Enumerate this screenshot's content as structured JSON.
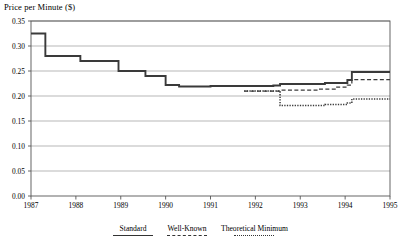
{
  "chart_data": {
    "type": "line",
    "title": "Price per Minute ($)",
    "xlabel": "",
    "ylabel": "Price per Minute ($)",
    "ylim": [
      0.0,
      0.35
    ],
    "xlim": [
      1987,
      1995
    ],
    "ytick_labels": [
      "0.00",
      "0.05",
      "0.10",
      "0.15",
      "0.20",
      "0.25",
      "0.30",
      "0.35"
    ],
    "ytick_values": [
      0.0,
      0.05,
      0.1,
      0.15,
      0.2,
      0.25,
      0.3,
      0.35
    ],
    "xtick_labels": [
      "1987",
      "1988",
      "1989",
      "1990",
      "1991",
      "1992",
      "1993",
      "1994",
      "1995"
    ],
    "xtick_values": [
      1987,
      1988,
      1989,
      1990,
      1991,
      1992,
      1993,
      1994,
      1995
    ],
    "grid": "horizontal",
    "legend_position": "below-axis",
    "step_style": "post",
    "series": [
      {
        "name": "Standard",
        "style": "solid",
        "x": [
          1987.0,
          1987.3,
          1987.32,
          1988.1,
          1988.95,
          1989.55,
          1990.0,
          1990.3,
          1991.0,
          1992.4,
          1992.55,
          1993.55,
          1994.05,
          1994.15,
          1995.0
        ],
        "values": [
          0.325,
          0.325,
          0.28,
          0.27,
          0.25,
          0.24,
          0.222,
          0.219,
          0.22,
          0.221,
          0.224,
          0.226,
          0.232,
          0.248,
          0.248
        ]
      },
      {
        "name": "Well-Known",
        "style": "dashed",
        "x": [
          1991.75,
          1992.4,
          1992.55,
          1993.4,
          1993.8,
          1994.05,
          1994.15,
          1995.0
        ],
        "values": [
          0.21,
          0.21,
          0.212,
          0.214,
          0.218,
          0.222,
          0.233,
          0.233
        ]
      },
      {
        "name": "Theoretical Minimum",
        "style": "dotted",
        "x": [
          1991.75,
          1992.4,
          1992.55,
          1993.55,
          1994.05,
          1994.15,
          1995.0
        ],
        "values": [
          0.21,
          0.21,
          0.181,
          0.183,
          0.186,
          0.194,
          0.194
        ]
      }
    ]
  },
  "legend": {
    "items": [
      {
        "label": "Standard",
        "style": "solid"
      },
      {
        "label": "Well-Known",
        "style": "dashed"
      },
      {
        "label": "Theoretical Minimum",
        "style": "dotted"
      }
    ]
  },
  "colors": {
    "line": "#3a3a3a",
    "grid": "#9a9a9a",
    "axis": "#555555",
    "background": "#ffffff"
  }
}
